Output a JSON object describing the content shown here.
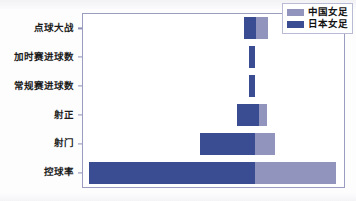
{
  "chart_data": {
    "type": "bar",
    "orientation": "horizontal-diverging",
    "title": "",
    "xlabel": "",
    "ylabel": "",
    "grid": false,
    "legend_position": "top-right",
    "categories": [
      "控球率",
      "射门",
      "射正",
      "常规赛进球数",
      "加时赛进球数",
      "点球大战"
    ],
    "series": [
      {
        "name": "中国女足",
        "color": "#9194bd",
        "values": [
          31,
          8,
          3,
          0,
          0,
          2
        ]
      },
      {
        "name": "日本女足",
        "color": "#3b4d92",
        "values": [
          64,
          21,
          8,
          1,
          1,
          2
        ]
      }
    ],
    "axis": {
      "x_visible_ticks": false,
      "y_ticks": [
        "点球大战",
        "加时赛进球数",
        "常规赛进球数",
        "射正",
        "射门",
        "控球率"
      ]
    }
  },
  "legend": {
    "entries": [
      {
        "label": "中国女足",
        "color": "#9194bd"
      },
      {
        "label": "日本女足",
        "color": "#3b4d92"
      }
    ]
  },
  "rows": [
    {
      "label": "点球大战",
      "japan_left_pct": 61.8,
      "japan_width_pct": 4.6,
      "china_left_pct": 66.4,
      "china_width_pct": 4.6
    },
    {
      "label": "加时赛进球数",
      "japan_left_pct": 63.6,
      "japan_width_pct": 2.3,
      "china_left_pct": 65.9,
      "china_width_pct": 0.0
    },
    {
      "label": "常规赛进球数",
      "japan_left_pct": 63.6,
      "japan_width_pct": 2.3,
      "china_left_pct": 65.9,
      "china_width_pct": 0.0
    },
    {
      "label": "射正",
      "japan_left_pct": 59.0,
      "japan_width_pct": 8.4,
      "china_left_pct": 67.4,
      "china_width_pct": 3.1
    },
    {
      "label": "射门",
      "japan_left_pct": 44.8,
      "japan_width_pct": 21.1,
      "china_left_pct": 65.9,
      "china_width_pct": 7.7
    },
    {
      "label": "控球率",
      "japan_left_pct": 2.3,
      "japan_width_pct": 63.6,
      "china_left_pct": 65.9,
      "china_width_pct": 31.0
    }
  ],
  "colors": {
    "japan": "#3b4d92",
    "china": "#9194bd",
    "frame": "#9a9cc0",
    "plot_background": "#ffffff",
    "figure_background": "#fdfdfe"
  }
}
